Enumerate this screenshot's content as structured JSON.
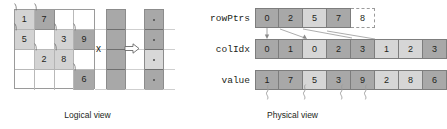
{
  "diagram": {
    "captions": {
      "logical": "Logical view",
      "physical": "Physical view"
    },
    "operator": {
      "multiply_symbol": "x",
      "result_arrow": "right-arrow"
    }
  },
  "logical": {
    "matrix": {
      "rows": 4,
      "cols": 4,
      "cells": [
        [
          {
            "value": "1",
            "nonzero": true,
            "shade": "light"
          },
          {
            "value": "7",
            "nonzero": true,
            "shade": "dark"
          },
          {
            "value": "",
            "nonzero": false,
            "shade": "none"
          },
          {
            "value": "",
            "nonzero": false,
            "shade": "none"
          }
        ],
        [
          {
            "value": "5",
            "nonzero": true,
            "shade": "light"
          },
          {
            "value": "",
            "nonzero": false,
            "shade": "none"
          },
          {
            "value": "3",
            "nonzero": true,
            "shade": "light"
          },
          {
            "value": "9",
            "nonzero": true,
            "shade": "dark"
          }
        ],
        [
          {
            "value": "",
            "nonzero": false,
            "shade": "none"
          },
          {
            "value": "2",
            "nonzero": true,
            "shade": "light"
          },
          {
            "value": "8",
            "nonzero": true,
            "shade": "light"
          },
          {
            "value": "",
            "nonzero": false,
            "shade": "none"
          }
        ],
        [
          {
            "value": "",
            "nonzero": false,
            "shade": "none"
          },
          {
            "value": "",
            "nonzero": false,
            "shade": "none"
          },
          {
            "value": "",
            "nonzero": false,
            "shade": "none"
          },
          {
            "value": "6",
            "nonzero": true,
            "shade": "dark"
          }
        ]
      ]
    },
    "input_vector": {
      "segments": [
        "dark",
        "dark",
        "dark",
        "dark"
      ]
    },
    "result_vector": {
      "segments": [
        "dark",
        "dark",
        "light",
        "dark"
      ]
    }
  },
  "physical": {
    "rows": [
      {
        "label": "rowPtrs",
        "cells": [
          {
            "value": "0",
            "shade": "dark"
          },
          {
            "value": "2",
            "shade": "dark"
          },
          {
            "value": "5",
            "shade": "light"
          },
          {
            "value": "7",
            "shade": "dark"
          },
          {
            "value": "8",
            "shade": "empty"
          }
        ]
      },
      {
        "label": "colIdx",
        "cells": [
          {
            "value": "0",
            "shade": "dark"
          },
          {
            "value": "1",
            "shade": "dark"
          },
          {
            "value": "0",
            "shade": "light"
          },
          {
            "value": "2",
            "shade": "dark"
          },
          {
            "value": "3",
            "shade": "dark"
          },
          {
            "value": "1",
            "shade": "light"
          },
          {
            "value": "2",
            "shade": "light"
          },
          {
            "value": "3",
            "shade": "dark"
          }
        ]
      },
      {
        "label": "value",
        "cells": [
          {
            "value": "1",
            "shade": "dark"
          },
          {
            "value": "7",
            "shade": "dark"
          },
          {
            "value": "5",
            "shade": "light"
          },
          {
            "value": "3",
            "shade": "dark"
          },
          {
            "value": "9",
            "shade": "dark"
          },
          {
            "value": "2",
            "shade": "light"
          },
          {
            "value": "8",
            "shade": "light"
          },
          {
            "value": "6",
            "shade": "dark"
          }
        ]
      }
    ]
  },
  "colors": {
    "dark_fill": "#a8a8a8",
    "light_fill": "#d6d6d6",
    "stroke": "#7d7d7d",
    "text": "#231f20"
  }
}
